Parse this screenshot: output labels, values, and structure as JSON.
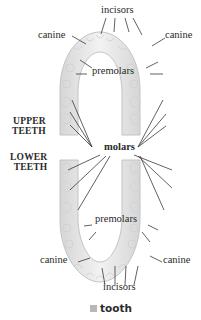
{
  "diagram": {
    "colors": {
      "tooth_fill": "#e8e8e8",
      "tooth_edge": "#c4c4c4",
      "leader_line": "#3a3a3a",
      "text": "#2a2a2a",
      "legend_swatch": "#b8b8b8"
    },
    "labels": {
      "incisors_top": "incisors",
      "canine_top_left": "canine",
      "canine_top_right": "canine",
      "premolars_top": "premolars",
      "upper_teeth": [
        "UPPER",
        "TEETH"
      ],
      "lower_teeth": [
        "LOWER",
        "TEETH"
      ],
      "molars": "molars",
      "premolars_bottom": "premolars",
      "canine_bottom_left": "canine",
      "canine_bottom_right": "canine",
      "incisors_bottom": "incisors"
    },
    "legend": {
      "swatch_label": "tooth"
    }
  }
}
